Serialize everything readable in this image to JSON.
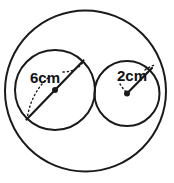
{
  "figure": {
    "background_color": "#ffffff",
    "stroke_color": "#1a1a1a",
    "label_color": "#111111",
    "width": 174,
    "height": 183
  },
  "shapes": {
    "outer_circle": {
      "name": "outer-circle",
      "cx": 85.5,
      "cy": 91,
      "r": 80.5,
      "stroke_width": 2,
      "fill": "none"
    },
    "large_inner_circle": {
      "name": "large-inner-circle",
      "cx": 55,
      "cy": 90,
      "r": 40,
      "stroke_width": 2,
      "fill": "none"
    },
    "small_inner_circle": {
      "name": "small-inner-circle",
      "cx": 127,
      "cy": 93.5,
      "r": 32.5,
      "stroke_width": 2,
      "fill": "none"
    }
  },
  "measurements": [
    {
      "id": "large-circle-diameter",
      "label": "6cm",
      "label_x": 30,
      "label_y": 83,
      "font_size": 15,
      "kind": "diameter",
      "line": {
        "x1": 26.5,
        "y1": 119.5,
        "x2": 83.5,
        "y2": 60.5
      },
      "center_dot": {
        "cx": 55,
        "cy": 90,
        "r": 3
      },
      "leader_dots": "M 63 72 C 74 72, 82 66, 83.5 60.5",
      "arc_dots": "M 27 119.5 C 29 104, 36 88, 49 77"
    },
    {
      "id": "small-circle-radius",
      "label": "2cm",
      "label_x": 117,
      "label_y": 81,
      "font_size": 15,
      "kind": "radius",
      "line": {
        "x1": 127,
        "y1": 93.5,
        "x2": 152,
        "y2": 68
      },
      "center_dot": {
        "cx": 127,
        "cy": 93.5,
        "r": 3
      },
      "leader_dots": "M 145 70 C 149 67, 152 66, 154 65",
      "arc_dots": "M 120 84 C 122 87, 124 90, 126.5 92.5"
    }
  ]
}
